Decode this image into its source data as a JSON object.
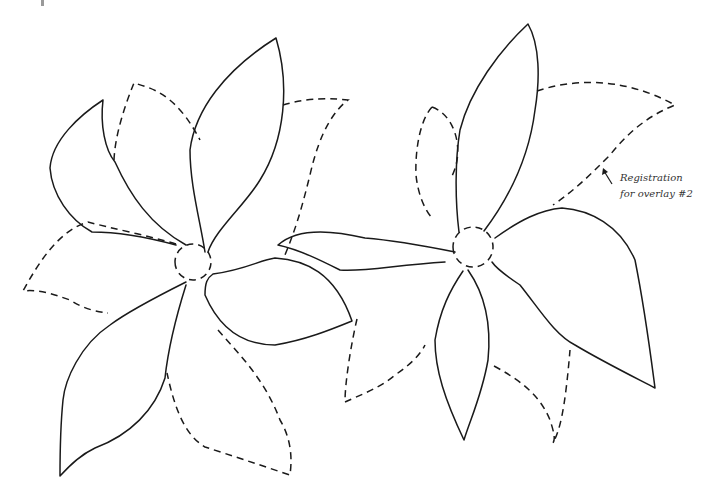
{
  "figure": {
    "type": "line-art pattern",
    "stroke_color": "#1a1a1a",
    "background": "#ffffff"
  },
  "annotation": {
    "line1": "Registration",
    "line2": "for overlay #2",
    "arrow_from": [
      612,
      184
    ],
    "arrow_to": [
      603,
      168
    ]
  },
  "flowers": [
    {
      "name": "left-flower",
      "center": [
        193,
        262
      ],
      "solid_petals": [
        "M176,245 C150,238 120,232 92,232 C70,220 52,195 50,168 C52,140 80,115 103,100 C100,125 105,150 115,162 C130,195 150,225 186,245",
        "M205,252 C200,220 190,185 190,150 C195,110 225,70 276,38 C290,85 285,140 260,180 C245,205 215,230 208,252",
        "M213,274 C245,270 260,260 275,258 C305,260 335,272 352,321 C330,330 305,340 275,345 C245,345 220,330 205,295 C205,283 207,278 213,274",
        "M186,282 C160,295 130,310 110,325 C80,345 65,380 63,400 C60,430 60,460 60,476 C70,465 80,455 95,448 C130,435 155,410 165,378 C168,350 175,320 186,285"
      ],
      "dashed_petals": [
        "M176,244 C150,236 110,228 88,222 C60,230 40,260 23,291 C40,289 55,295 70,300 C85,310 100,312 108,313",
        "M114,160 C115,135 125,105 134,83 C150,88 175,92 200,140",
        "M283,105 C300,100 320,97 348,100 C335,110 320,130 310,175 C300,215 295,230 285,255",
        "M218,330 C240,355 265,380 280,420 C292,440 292,460 290,475 C260,465 230,455 205,447 C185,435 175,410 167,373",
        "M193,262 m-18,0 a18,18 0 1,0 36,0 a18,18 0 1,0 -36,0"
      ]
    },
    {
      "name": "right-flower",
      "center": [
        473,
        247
      ],
      "solid_petals": [
        "M459,232 C455,200 455,160 460,130 C470,90 500,50 528,24 C540,45 540,80 535,110 C530,150 515,190 484,231",
        "M495,238 C520,220 540,210 562,208 C590,210 620,225 635,260 C645,310 650,350 655,388 C630,375 600,360 575,345 C555,335 540,310 520,285 C505,275 496,268 492,262",
        "M463,271 C450,290 440,310 435,340 C435,370 445,400 464,440 C470,420 482,395 488,360 C492,320 482,290 468,270",
        "M455,252 C420,245 390,240 365,238 C340,232 300,225 278,245 C300,250 320,260 340,270 C365,272 395,265 445,262"
      ],
      "dashed_petals": [
        "M432,107 C455,115 465,150 452,176",
        "M432,107 C420,120 415,150 416,175 C418,195 425,210 432,218",
        "M537,91 C570,80 620,75 675,105 C650,115 630,130 610,155 C590,175 575,190 553,205",
        "M357,319 C352,340 345,380 345,402 C360,395 380,388 395,375 C410,365 420,355 425,345",
        "M494,366 C520,380 540,395 550,420 C555,435 555,440 553,443 C560,430 565,410 570,350",
        "M473,247 m-20,0 a20,20 0 1,0 40,0 a20,20 0 1,0 -40,0"
      ]
    }
  ]
}
